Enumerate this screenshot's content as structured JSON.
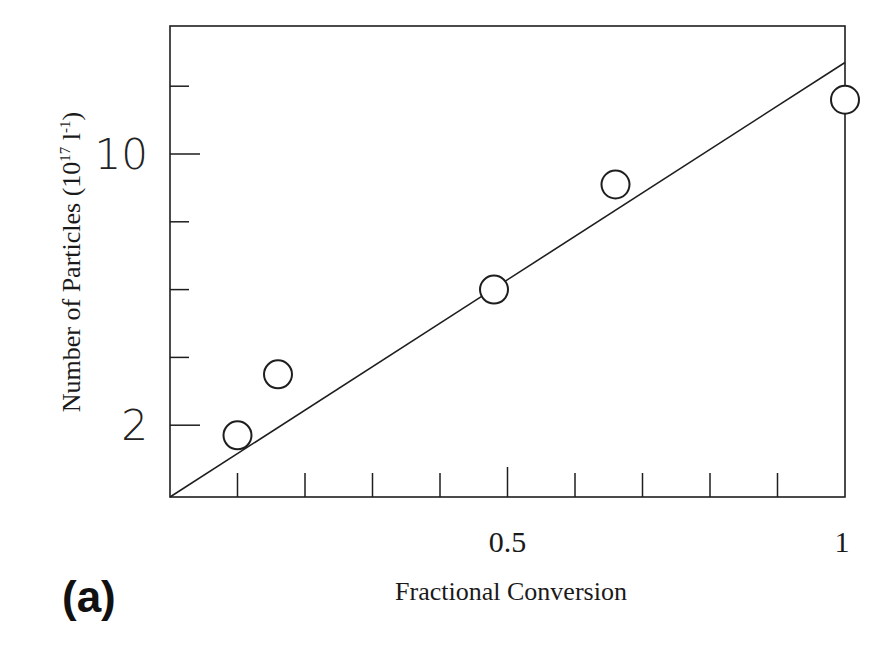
{
  "panel_label": "(a)",
  "chart_data": {
    "type": "scatter",
    "title": "",
    "xlabel": "Fractional Conversion",
    "ylabel": "Number of Particles (10^17 l^-1)",
    "ylabel_parts": {
      "main": "Number of Particles (10",
      "exp1": "17",
      "mid": " l",
      "exp2": "-1",
      "end": ")"
    },
    "xlim": [
      0,
      1
    ],
    "ylim": [
      0,
      13
    ],
    "grid": false,
    "legend": null,
    "x_ticks": [
      0.1,
      0.2,
      0.3,
      0.4,
      0.5,
      0.6,
      0.7,
      0.8,
      0.9,
      1.0
    ],
    "x_tick_labels": [
      {
        "value": 0.5,
        "label": "0.5"
      },
      {
        "value": 1.0,
        "label": "1"
      }
    ],
    "y_ticks": [
      2,
      4,
      6,
      8,
      10,
      12
    ],
    "y_tick_labels": [
      {
        "value": 2,
        "label": "2"
      },
      {
        "value": 10,
        "label": "10"
      }
    ],
    "series": [
      {
        "name": "measured",
        "marker": "open-circle",
        "x": [
          0.1,
          0.16,
          0.48,
          0.66,
          1.0
        ],
        "y": [
          1.7,
          3.5,
          6.0,
          9.1,
          11.6
        ]
      },
      {
        "name": "fit",
        "style": "line",
        "x": [
          0,
          1.0
        ],
        "y": [
          0,
          12.7
        ]
      }
    ]
  }
}
